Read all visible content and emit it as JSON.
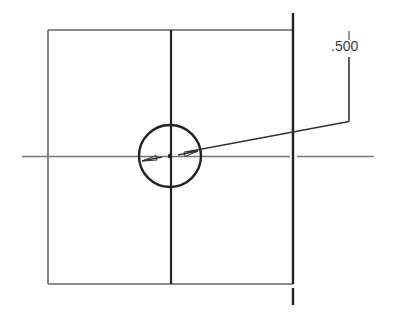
{
  "drawing": {
    "type": "engineering-view",
    "colors": {
      "background": "#ffffff",
      "outline": "#555555",
      "heavy_line": "#222222",
      "center_line": "#777777",
      "text": "#3a3a3a"
    },
    "dimensions": [
      {
        "label": ".500",
        "feature": "circle-hole",
        "kind": "diameter-leader"
      }
    ]
  }
}
